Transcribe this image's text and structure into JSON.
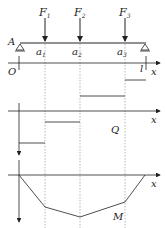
{
  "diagram": {
    "type": "beam-shear-moment",
    "beam": {
      "support_left_label": "A",
      "origin_label": "O",
      "length_label": "l",
      "axis_label": "x"
    },
    "loads": [
      {
        "label": "F",
        "sub": "1",
        "position_label": "a",
        "position_sub": "1"
      },
      {
        "label": "F",
        "sub": "2",
        "position_label": "a",
        "position_sub": "2"
      },
      {
        "label": "F",
        "sub": "3",
        "position_label": "a",
        "position_sub": "3"
      }
    ],
    "shear_diagram": {
      "label": "Q",
      "axis_label": "x"
    },
    "moment_diagram": {
      "label": "M",
      "axis_label": "x"
    },
    "colors": {
      "line": "#222222",
      "dashed": "#999999"
    }
  }
}
